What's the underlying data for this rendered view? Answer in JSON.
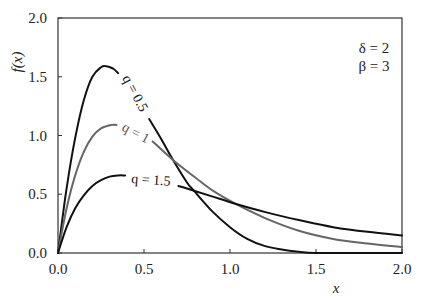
{
  "chart_data": {
    "type": "line",
    "title": "",
    "xlabel": "x",
    "ylabel": "f(x)",
    "xlim": [
      0.0,
      2.0
    ],
    "ylim": [
      0.0,
      2.0
    ],
    "xticks": [
      "0.0",
      "0.5",
      "1.0",
      "1.5",
      "2.0"
    ],
    "yticks": [
      "0.0",
      "0.5",
      "1.0",
      "1.5",
      "2.0"
    ],
    "grid": false,
    "annotations": [
      "δ = 2",
      "β = 3"
    ],
    "series": [
      {
        "name": "q = 0.5",
        "label": "q = 0.5",
        "color": "#111111",
        "x": [
          0.0,
          0.05,
          0.1,
          0.15,
          0.2,
          0.25,
          0.28,
          0.32,
          0.35,
          0.53,
          0.6,
          0.67,
          0.75,
          0.79,
          0.9,
          1.0,
          1.1,
          1.2,
          1.3,
          1.4,
          1.5,
          1.7,
          2.0
        ],
        "y": [
          0.0,
          0.55,
          0.98,
          1.3,
          1.5,
          1.58,
          1.59,
          1.57,
          1.53,
          1.14,
          0.97,
          0.79,
          0.6,
          0.53,
          0.35,
          0.22,
          0.12,
          0.06,
          0.03,
          0.01,
          0.0,
          0.0,
          0.0
        ]
      },
      {
        "name": "q = 1",
        "label": "q = 1",
        "color": "#666666",
        "x": [
          0.0,
          0.05,
          0.1,
          0.15,
          0.2,
          0.25,
          0.31,
          0.34,
          0.55,
          0.67,
          0.8,
          0.9,
          1.03,
          1.2,
          1.4,
          1.6,
          1.8,
          2.0
        ],
        "y": [
          0.0,
          0.38,
          0.66,
          0.86,
          0.99,
          1.06,
          1.09,
          1.09,
          0.95,
          0.79,
          0.64,
          0.53,
          0.42,
          0.3,
          0.19,
          0.12,
          0.08,
          0.05
        ]
      },
      {
        "name": "q = 1.5",
        "label": "q = 1.5",
        "color": "#111111",
        "x": [
          0.0,
          0.05,
          0.1,
          0.15,
          0.2,
          0.25,
          0.3,
          0.35,
          0.39,
          0.7,
          0.79,
          0.9,
          1.03,
          1.2,
          1.4,
          1.6,
          1.8,
          2.0
        ],
        "y": [
          0.0,
          0.22,
          0.38,
          0.49,
          0.57,
          0.62,
          0.65,
          0.66,
          0.66,
          0.57,
          0.53,
          0.48,
          0.42,
          0.35,
          0.28,
          0.22,
          0.18,
          0.15
        ]
      }
    ],
    "label_gaps": [
      {
        "series": "q = 0.5",
        "from": 0.35,
        "to": 0.53
      },
      {
        "series": "q = 1",
        "from": 0.34,
        "to": 0.55
      },
      {
        "series": "q = 1.5",
        "from": 0.39,
        "to": 0.7
      }
    ]
  },
  "labels": {
    "xlabel": "x",
    "ylabel": "f(x)",
    "annot_delta": "δ = 2",
    "annot_beta": "β = 3",
    "curve_q05": "q = 0.5",
    "curve_q1": "q = 1",
    "curve_q15": "q = 1.5"
  }
}
